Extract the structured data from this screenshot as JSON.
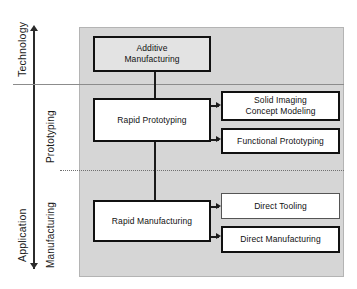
{
  "diagram": {
    "panel_color": "#d6d6d6",
    "axis": {
      "name": "vertical-axis",
      "top_label": "Technology",
      "bottom_label": "Application",
      "inner_upper_label": "Prototyping",
      "inner_lower_label": "Manufacturing"
    },
    "nodes": {
      "additive_manufacturing": {
        "line1": "Additive",
        "line2": "Manufacturing"
      },
      "rapid_prototyping": {
        "line1": "Rapid Prototyping"
      },
      "rapid_manufacturing": {
        "line1": "Rapid Manufacturing"
      },
      "solid_imaging": {
        "line1": "Solid Imaging",
        "line2": "Concept Modeling"
      },
      "functional_prototyping": {
        "line1": "Functional Prototyping"
      },
      "direct_tooling": {
        "line1": "Direct Tooling"
      },
      "direct_manufacturing": {
        "line1": "Direct Manufacturing"
      }
    }
  }
}
